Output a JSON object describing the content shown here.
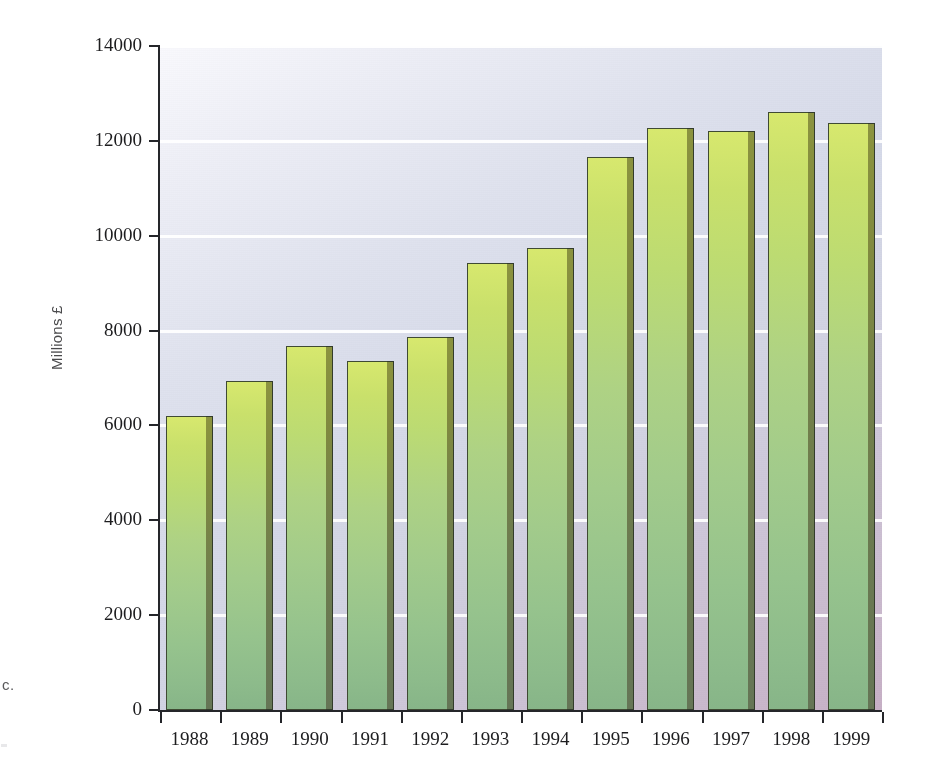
{
  "edge_caption": {
    "fragment": "c."
  },
  "chart_data": {
    "type": "bar",
    "title": "",
    "subtitle": "",
    "xlabel": "",
    "ylabel": "Millions £",
    "categories": [
      "1988",
      "1989",
      "1990",
      "1991",
      "1992",
      "1993",
      "1994",
      "1995",
      "1996",
      "1997",
      "1998",
      "1999"
    ],
    "values": [
      6200,
      6930,
      7680,
      7350,
      7870,
      9430,
      9740,
      11660,
      12270,
      12200,
      12600,
      12370
    ],
    "ylim": [
      0,
      14000
    ],
    "ytick_labels": [
      "0",
      "2000",
      "4000",
      "6000",
      "8000",
      "10000",
      "12000",
      "14000"
    ],
    "ytick_values": [
      0,
      2000,
      4000,
      6000,
      8000,
      10000,
      12000,
      14000
    ],
    "grid": "horizontal-white-lines",
    "legend": "none",
    "bar_color_top": "#cde06c",
    "bar_color_bottom": "#88b689",
    "bar_side_color": "#74814a",
    "plot_bg_top_left": "#f7f8fc",
    "plot_bg_bottom_right": "#c7b0c6",
    "axis_color": "#25262a"
  }
}
